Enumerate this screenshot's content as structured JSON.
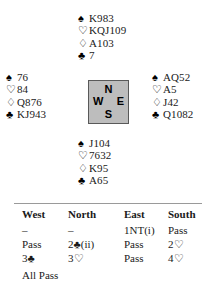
{
  "artifact": {
    "text": ""
  },
  "hands": {
    "north": {
      "label": "North hand",
      "suits": [
        {
          "icon": "spade-icon",
          "symbol": "♠",
          "style": "black",
          "cards": "K983"
        },
        {
          "icon": "heart-icon",
          "symbol": "♡",
          "style": "hollow",
          "cards": "KQJ109"
        },
        {
          "icon": "diamond-icon",
          "symbol": "♢",
          "style": "hollow",
          "cards": "A103"
        },
        {
          "icon": "club-icon",
          "symbol": "♣",
          "style": "black",
          "cards": "7"
        }
      ]
    },
    "west": {
      "label": "West hand",
      "suits": [
        {
          "icon": "spade-icon",
          "symbol": "♠",
          "style": "black",
          "cards": "76"
        },
        {
          "icon": "heart-icon",
          "symbol": "♡",
          "style": "hollow",
          "cards": "84"
        },
        {
          "icon": "diamond-icon",
          "symbol": "♢",
          "style": "hollow",
          "cards": "Q876"
        },
        {
          "icon": "club-icon",
          "symbol": "♣",
          "style": "black",
          "cards": "KJ943"
        }
      ]
    },
    "east": {
      "label": "East hand",
      "suits": [
        {
          "icon": "spade-icon",
          "symbol": "♠",
          "style": "black",
          "cards": "AQ52"
        },
        {
          "icon": "heart-icon",
          "symbol": "♡",
          "style": "hollow",
          "cards": "A5"
        },
        {
          "icon": "diamond-icon",
          "symbol": "♢",
          "style": "hollow",
          "cards": "J42"
        },
        {
          "icon": "club-icon",
          "symbol": "♣",
          "style": "black",
          "cards": "Q1082"
        }
      ]
    },
    "south": {
      "label": "South hand",
      "suits": [
        {
          "icon": "spade-icon",
          "symbol": "♠",
          "style": "black",
          "cards": "J104"
        },
        {
          "icon": "heart-icon",
          "symbol": "♡",
          "style": "hollow",
          "cards": "7632"
        },
        {
          "icon": "diamond-icon",
          "symbol": "♢",
          "style": "hollow",
          "cards": "K95"
        },
        {
          "icon": "club-icon",
          "symbol": "♣",
          "style": "black",
          "cards": "A65"
        }
      ]
    }
  },
  "compass": {
    "north": "N",
    "west": "W",
    "east": "E",
    "south": "S",
    "fill_color": "#bdbdbd",
    "border_color": "#595959"
  },
  "bidding": {
    "headers": [
      "West",
      "North",
      "East",
      "South"
    ],
    "rows": [
      [
        "–",
        "–",
        "1NT(i)",
        "Pass"
      ],
      [
        "Pass",
        "2♣(ii)",
        "Pass",
        "2♡"
      ],
      [
        "3♣",
        "3♡",
        "Pass",
        "4♡"
      ]
    ],
    "final": "All Pass"
  }
}
